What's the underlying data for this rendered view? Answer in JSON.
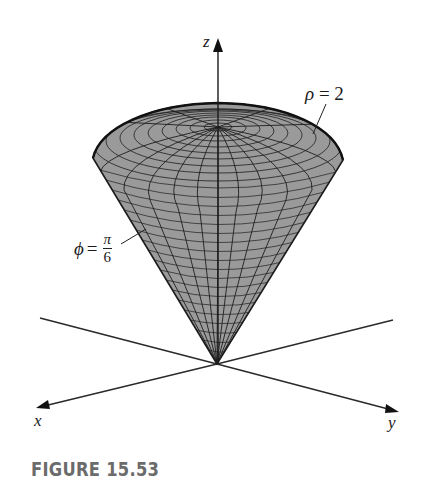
{
  "figure": {
    "caption": "FIGURE 15.53",
    "axes": {
      "z": "z",
      "x": "x",
      "y": "y"
    },
    "annotations": {
      "sphere": {
        "symbol": "ρ",
        "equals": " = 2"
      },
      "cone": {
        "symbol": "ϕ",
        "equals": " =",
        "numerator": "π",
        "denominator": "6"
      }
    },
    "colors": {
      "surface_fill": "#9a9a9a",
      "mesh_lines": "#1e1e1e",
      "axis_lines": "#2a2a2a",
      "caption": "#6b6b6b"
    }
  }
}
